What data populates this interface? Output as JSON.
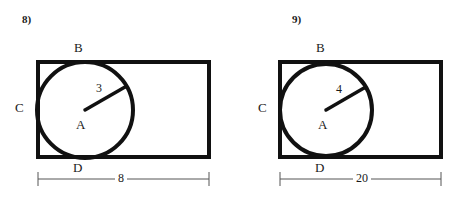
{
  "page": {
    "background_color": "#ffffff",
    "stroke_color": "#111111",
    "dimension_line_color": "#555555"
  },
  "figures": [
    {
      "number_label": "8)",
      "vertex_labels": {
        "top": "B",
        "left": "C",
        "center": "A",
        "bottom": "D"
      },
      "radius_label": "3",
      "width_label": "8"
    },
    {
      "number_label": "9)",
      "vertex_labels": {
        "top": "B",
        "left": "C",
        "center": "A",
        "bottom": "D"
      },
      "radius_label": "4",
      "width_label": "20"
    }
  ]
}
